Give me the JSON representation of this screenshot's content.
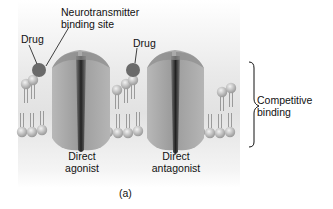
{
  "labels": {
    "nt_site_line1": "Neurotransmitter",
    "nt_site_line2": "binding site",
    "drug_left": "Drug",
    "drug_right": "Drug",
    "agonist_line1": "Direct",
    "agonist_line2": "agonist",
    "antagonist_line1": "Direct",
    "antagonist_line2": "antagonist",
    "brace_line1": "Competitive",
    "brace_line2": "binding",
    "panel_tag": "(a)"
  },
  "colors": {
    "receptor": "#a9a9a9",
    "receptor_dark": "#3a3a3a",
    "drug": "#6e6e6e",
    "lipid_head": "#bdbdbd",
    "background": "#e6e6e6"
  }
}
